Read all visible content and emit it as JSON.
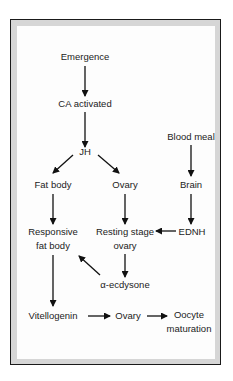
{
  "diagram": {
    "type": "flowchart",
    "nodes": {
      "emergence": "Emergence",
      "ca_activated": "CA activated",
      "jh": "JH",
      "fat_body": "Fat body",
      "ovary_top": "Ovary",
      "blood_meal": "Blood meal",
      "brain": "Brain",
      "responsive_line1": "Responsive",
      "responsive_line2": "fat body",
      "resting_line1": "Resting stage",
      "resting_line2": "ovary",
      "ednh": "EDNH",
      "ecdysone": "α-ecdysone",
      "vitellogenin": "Vitellogenin",
      "ovary_bottom": "Ovary",
      "oocyte_line1": "Oocyte",
      "oocyte_line2": "maturation"
    },
    "edges": [
      [
        "Emergence",
        "CA activated"
      ],
      [
        "CA activated",
        "JH"
      ],
      [
        "JH",
        "Fat body"
      ],
      [
        "JH",
        "Ovary"
      ],
      [
        "Blood meal",
        "Brain"
      ],
      [
        "Brain",
        "EDNH"
      ],
      [
        "Fat body",
        "Responsive fat body"
      ],
      [
        "Ovary",
        "Resting stage ovary"
      ],
      [
        "EDNH",
        "Resting stage ovary"
      ],
      [
        "Resting stage ovary",
        "α-ecdysone"
      ],
      [
        "α-ecdysone",
        "Responsive fat body"
      ],
      [
        "Responsive fat body",
        "Vitellogenin"
      ],
      [
        "Vitellogenin",
        "Ovary"
      ],
      [
        "Ovary",
        "Oocyte maturation"
      ]
    ],
    "colors": {
      "frame_border": "#1a1a1a",
      "frame_band": "#d6d6d6",
      "text": "#222222",
      "arrow": "#111111"
    }
  }
}
